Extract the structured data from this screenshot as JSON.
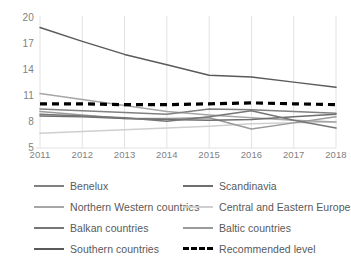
{
  "chart_data": {
    "type": "line",
    "title": "",
    "xlabel": "",
    "ylabel": "",
    "x": [
      2011,
      2012,
      2013,
      2014,
      2015,
      2016,
      2017,
      2018
    ],
    "categories": [
      "2011",
      "2012",
      "2013",
      "2014",
      "2015",
      "2016",
      "2017",
      "2018"
    ],
    "ylim": [
      5,
      20
    ],
    "yticks": [
      20,
      17,
      14,
      11,
      8,
      5
    ],
    "grid": "vertical",
    "legend_position": "bottom",
    "series": [
      {
        "name": "Benelux",
        "color": "#808080",
        "style": "solid",
        "values": [
          9.5,
          9.3,
          9.1,
          8.9,
          9.5,
          9.4,
          9.2,
          9.0
        ]
      },
      {
        "name": "Scandinavia",
        "color": "#6e6e6e",
        "style": "solid",
        "values": [
          8.7,
          8.6,
          8.4,
          8.3,
          8.2,
          8.3,
          8.6,
          8.9
        ]
      },
      {
        "name": "Northern Western countries",
        "color": "#a6a6a6",
        "style": "solid",
        "values": [
          11.3,
          10.6,
          9.9,
          9.2,
          8.8,
          8.5,
          8.2,
          8.0
        ]
      },
      {
        "name": "Central and Eastern Europe",
        "color": "#cfcfcf",
        "style": "solid",
        "values": [
          6.7,
          6.9,
          7.1,
          7.3,
          7.5,
          7.8,
          7.9,
          8.0
        ]
      },
      {
        "name": "Balkan countries",
        "color": "#767676",
        "style": "solid",
        "values": [
          8.9,
          8.7,
          8.5,
          8.1,
          8.6,
          9.3,
          8.2,
          7.3
        ]
      },
      {
        "name": "Baltic countries",
        "color": "#9a9a9a",
        "style": "solid",
        "values": [
          9.2,
          8.8,
          8.4,
          8.4,
          8.5,
          7.2,
          7.9,
          8.6
        ]
      },
      {
        "name": "Southern countries",
        "color": "#5a5a5a",
        "style": "solid",
        "values": [
          18.9,
          17.3,
          15.8,
          14.6,
          13.4,
          13.2,
          12.6,
          12.0
        ]
      },
      {
        "name": "Recommended level",
        "color": "#000000",
        "style": "dashed",
        "values": [
          10.1,
          10.1,
          10.0,
          10.0,
          10.1,
          10.2,
          10.1,
          10.0
        ]
      }
    ]
  },
  "legend": {
    "rows": [
      [
        {
          "label": "Benelux",
          "series_index": 0
        },
        {
          "label": "Scandinavia",
          "series_index": 1
        }
      ],
      [
        {
          "label": "Northern Western countries",
          "series_index": 2
        },
        {
          "label": "Central and Eastern Europe",
          "series_index": 3
        }
      ],
      [
        {
          "label": "Balkan countries",
          "series_index": 4
        },
        {
          "label": "Baltic countries",
          "series_index": 5
        }
      ],
      [
        {
          "label": "Southern countries",
          "series_index": 6
        },
        {
          "label": "Recommended level",
          "series_index": 7
        }
      ]
    ]
  }
}
